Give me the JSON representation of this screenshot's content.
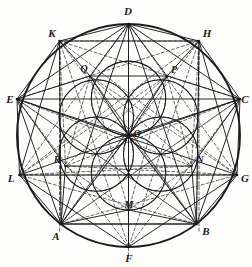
{
  "figure": {
    "canvas": {
      "width": 252,
      "height": 267
    },
    "colors": {
      "background": "#fdfdfb",
      "stroke_solid": "#1b1b1b",
      "stroke_dashed": "#3a3a3a",
      "label": "#1b1b1b"
    },
    "main_circle": {
      "cx": 128.5,
      "cy": 135.5,
      "r": 111.5
    },
    "inner_circle_radius": 37.2,
    "inner_circles": [
      {
        "name": "circle-top",
        "cx": 128.5,
        "cy": 98.3
      },
      {
        "name": "circle-upper-right",
        "cx": 160.7,
        "cy": 116.9
      },
      {
        "name": "circle-lower-right",
        "cx": 160.7,
        "cy": 154.1
      },
      {
        "name": "circle-bottom",
        "cx": 128.5,
        "cy": 172.7
      },
      {
        "name": "circle-lower-left",
        "cx": 96.3,
        "cy": 154.1
      },
      {
        "name": "circle-upper-left",
        "cx": 96.3,
        "cy": 116.9
      }
    ],
    "points": [
      {
        "id": "D",
        "label": "D",
        "x": 128.5,
        "y": 24.0,
        "label_x": 128.0,
        "label_y": 11.0
      },
      {
        "id": "H",
        "label": "H",
        "x": 199.0,
        "y": 41.0,
        "label_x": 207.0,
        "label_y": 33.0
      },
      {
        "id": "C",
        "label": "C",
        "x": 240.0,
        "y": 99.0,
        "label_x": 245.0,
        "label_y": 99.0
      },
      {
        "id": "G",
        "label": "G",
        "x": 237.0,
        "y": 175.0,
        "label_x": 245.0,
        "label_y": 178.0
      },
      {
        "id": "B",
        "label": "B",
        "x": 196.5,
        "y": 224.0,
        "label_x": 206.0,
        "label_y": 231.0
      },
      {
        "id": "F",
        "label": "F",
        "x": 128.5,
        "y": 247.0,
        "label_x": 129.0,
        "label_y": 258.0
      },
      {
        "id": "A",
        "label": "A",
        "x": 61.0,
        "y": 224.0,
        "label_x": 56.0,
        "label_y": 236.0
      },
      {
        "id": "L",
        "label": "L",
        "x": 19.5,
        "y": 175.0,
        "label_x": 11.0,
        "label_y": 178.0
      },
      {
        "id": "E",
        "label": "E",
        "x": 17.0,
        "y": 99.0,
        "label_x": 10.0,
        "label_y": 99.0
      },
      {
        "id": "K",
        "label": "K",
        "x": 59.5,
        "y": 41.0,
        "label_x": 52.0,
        "label_y": 33.0
      },
      {
        "id": "O",
        "label": "O",
        "x": 128.5,
        "y": 135.5,
        "label_x": 137.0,
        "label_y": 134.0
      },
      {
        "id": "Q",
        "label": "Q",
        "x": 90.0,
        "y": 76.0,
        "label_x": 84.0,
        "label_y": 69.0
      },
      {
        "id": "P",
        "label": "P",
        "x": 167.0,
        "y": 76.0,
        "label_x": 174.0,
        "label_y": 70.0
      },
      {
        "id": "R",
        "label": "R",
        "x": 65.5,
        "y": 166.0,
        "label_x": 57.0,
        "label_y": 160.0
      },
      {
        "id": "N",
        "label": "N",
        "x": 191.5,
        "y": 166.0,
        "label_x": 200.0,
        "label_y": 160.0
      },
      {
        "id": "M",
        "label": "M",
        "x": 128.5,
        "y": 210.0,
        "label_x": 129.0,
        "label_y": 205.0
      }
    ],
    "solid_edges": [
      [
        "E",
        "D"
      ],
      [
        "D",
        "C"
      ],
      [
        "C",
        "B"
      ],
      [
        "B",
        "A"
      ],
      [
        "A",
        "E"
      ],
      [
        "E",
        "C"
      ],
      [
        "A",
        "B"
      ],
      [
        "K",
        "H"
      ],
      [
        "H",
        "G"
      ],
      [
        "G",
        "F"
      ],
      [
        "F",
        "L"
      ],
      [
        "L",
        "K"
      ],
      [
        "E",
        "O"
      ],
      [
        "O",
        "C"
      ],
      [
        "D",
        "O"
      ],
      [
        "O",
        "F"
      ],
      [
        "A",
        "O"
      ],
      [
        "O",
        "B"
      ],
      [
        "L",
        "G"
      ],
      [
        "E",
        "G"
      ],
      [
        "L",
        "C"
      ],
      [
        "A",
        "D"
      ],
      [
        "D",
        "B"
      ],
      [
        "A",
        "K"
      ],
      [
        "K",
        "D"
      ],
      [
        "D",
        "H"
      ],
      [
        "H",
        "B"
      ],
      [
        "E",
        "K"
      ],
      [
        "H",
        "C"
      ],
      [
        "L",
        "A"
      ],
      [
        "B",
        "G"
      ],
      [
        "E",
        "L"
      ],
      [
        "C",
        "G"
      ],
      [
        "Q",
        "P"
      ],
      [
        "Q",
        "E"
      ],
      [
        "P",
        "C"
      ],
      [
        "R",
        "N"
      ],
      [
        "A",
        "R"
      ],
      [
        "B",
        "N"
      ],
      [
        "A",
        "M"
      ],
      [
        "M",
        "B"
      ],
      [
        "O",
        "M"
      ],
      [
        "E",
        "R"
      ],
      [
        "C",
        "N"
      ],
      [
        "Q",
        "O"
      ],
      [
        "P",
        "O"
      ],
      [
        "K",
        "Q"
      ],
      [
        "H",
        "P"
      ],
      [
        "Q",
        "D"
      ],
      [
        "P",
        "D"
      ]
    ],
    "dashed_edges": [
      [
        "K",
        "H"
      ],
      [
        "K",
        "C"
      ],
      [
        "H",
        "E"
      ],
      [
        "L",
        "G"
      ],
      [
        "L",
        "H"
      ],
      [
        "G",
        "K"
      ],
      [
        "A",
        "C"
      ],
      [
        "B",
        "E"
      ],
      [
        "A",
        "H"
      ],
      [
        "B",
        "K"
      ],
      [
        "L",
        "D"
      ],
      [
        "G",
        "D"
      ],
      [
        "E",
        "F"
      ],
      [
        "C",
        "F"
      ],
      [
        "K",
        "A"
      ],
      [
        "H",
        "B"
      ],
      [
        "K",
        "F"
      ],
      [
        "H",
        "F"
      ],
      [
        "A",
        "G"
      ],
      [
        "B",
        "L"
      ],
      [
        "E",
        "B"
      ],
      [
        "C",
        "A"
      ],
      [
        "Q",
        "N"
      ],
      [
        "P",
        "R"
      ],
      [
        "Q",
        "R"
      ],
      [
        "P",
        "N"
      ],
      [
        "Q",
        "M"
      ],
      [
        "P",
        "M"
      ],
      [
        "R",
        "M"
      ],
      [
        "N",
        "M"
      ],
      [
        "E",
        "N"
      ],
      [
        "C",
        "R"
      ],
      [
        "Q",
        "B"
      ],
      [
        "P",
        "A"
      ],
      [
        "L",
        "P"
      ],
      [
        "G",
        "Q"
      ],
      [
        "D",
        "M"
      ],
      [
        "M",
        "F"
      ],
      [
        "K",
        "R"
      ],
      [
        "H",
        "N"
      ],
      [
        "L",
        "N"
      ],
      [
        "G",
        "R"
      ],
      [
        "A",
        "P"
      ],
      [
        "B",
        "Q"
      ]
    ],
    "vertical_dashed_rules": [
      {
        "name": "rule-through-K-A",
        "x": 59.5,
        "y1": 41.0,
        "y2": 232.0
      },
      {
        "name": "rule-through-H-B",
        "x": 199.0,
        "y1": 41.0,
        "y2": 232.0
      },
      {
        "name": "rule-through-D-F",
        "x": 128.5,
        "y1": 24.0,
        "y2": 256.0
      }
    ],
    "label_note": "Italic serif capital letters mark the named points of the construction."
  }
}
